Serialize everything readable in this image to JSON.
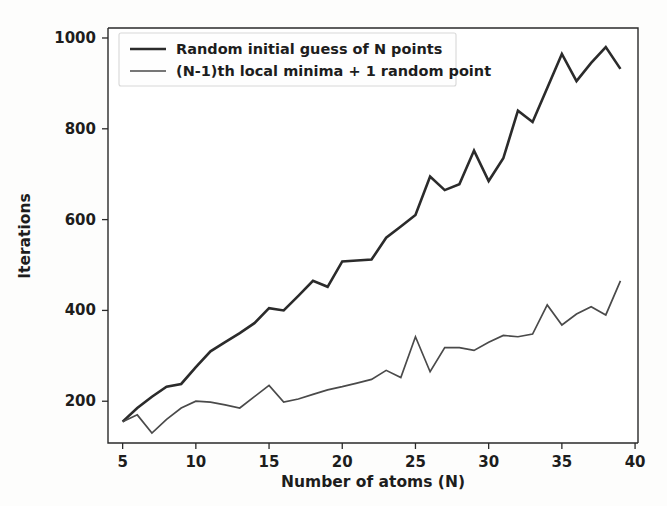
{
  "figure": {
    "background_color": "#fdfdfc",
    "plot_background_color": "#ffffff",
    "axis_color": "#2a2a2a"
  },
  "chart_data": {
    "type": "line",
    "title": "",
    "xlabel": "Number of atoms (N)",
    "ylabel": "Iterations",
    "xlim": [
      4.0,
      40.2
    ],
    "ylim": [
      108,
      1022
    ],
    "xticks": [
      5,
      10,
      15,
      20,
      25,
      30,
      35,
      40
    ],
    "yticks": [
      200,
      400,
      600,
      800,
      1000
    ],
    "grid": false,
    "legend_position": "upper left",
    "x": [
      5,
      6,
      7,
      8,
      9,
      10,
      11,
      12,
      13,
      14,
      15,
      16,
      17,
      18,
      19,
      20,
      21,
      22,
      23,
      24,
      25,
      26,
      27,
      28,
      29,
      30,
      31,
      32,
      33,
      34,
      35,
      36,
      37,
      38,
      39
    ],
    "series": [
      {
        "name": "Random initial guess of N points",
        "color": "#2b2b2b",
        "linewidth": 2.6,
        "values": [
          155,
          185,
          210,
          232,
          238,
          275,
          310,
          330,
          350,
          372,
          405,
          400,
          432,
          465,
          452,
          508,
          510,
          512,
          560,
          585,
          610,
          695,
          665,
          678,
          752,
          685,
          735,
          840,
          815,
          890,
          965,
          905,
          945,
          980,
          932
        ]
      },
      {
        "name": "(N-1)th local minima + 1 random point",
        "color": "#4a4a4a",
        "linewidth": 1.7,
        "values": [
          155,
          170,
          130,
          160,
          185,
          200,
          198,
          192,
          185,
          210,
          235,
          198,
          205,
          215,
          225,
          232,
          240,
          248,
          268,
          252,
          342,
          265,
          318,
          318,
          312,
          330,
          345,
          342,
          348,
          412,
          368,
          392,
          408,
          390,
          465
        ]
      }
    ]
  },
  "legend": {
    "items": [
      {
        "label": "Random initial guess of N points"
      },
      {
        "label": "(N-1)th local minima + 1 random point"
      }
    ]
  }
}
